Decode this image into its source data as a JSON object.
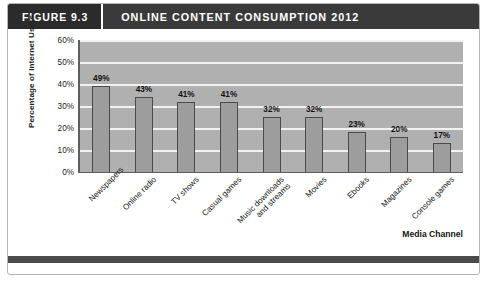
{
  "figure": {
    "number_label": "FIGURE 9.3",
    "title": "ONLINE CONTENT CONSUMPTION 2012"
  },
  "colors": {
    "header_band": "#3a3a3a",
    "figure_number_block": "#2b2b2b",
    "plot_background": "#b0b0b0",
    "gridline": "#f2f2f2",
    "bar_fill": "#9d9d9d",
    "bar_border": "#4a4a4a",
    "axis_line": "#5e5e5e",
    "bottom_rule": "#4a4a4a",
    "frame_border": "#b4b4b4"
  },
  "chart_data": {
    "type": "bar",
    "title": "ONLINE CONTENT CONSUMPTION 2012",
    "xlabel": "Media Channel",
    "ylabel": "Percentage of Internet Users",
    "ylim": [
      0,
      60
    ],
    "ytick_labels": [
      "60%",
      "50%",
      "40%",
      "30%",
      "20%",
      "10%",
      "0%"
    ],
    "yticks": [
      60,
      50,
      40,
      30,
      20,
      10,
      0
    ],
    "grid": true,
    "legend": "none",
    "categories": [
      "Newspapers",
      "Online radio",
      "TV shows",
      "Casual games",
      "Music downloads\nand streams",
      "Movies",
      "Ebooks",
      "Magazines",
      "Console games"
    ],
    "values": [
      49,
      43,
      41,
      41,
      32,
      32,
      23,
      20,
      17
    ],
    "value_labels": [
      "49%",
      "43%",
      "41%",
      "41%",
      "32%",
      "32%",
      "23%",
      "20%",
      "17%"
    ],
    "drawn_bar_heights": [
      39,
      34,
      32,
      32,
      25,
      25,
      18,
      16,
      13
    ]
  },
  "category_label_lines": [
    [
      "Newspapers"
    ],
    [
      "Online radio"
    ],
    [
      "TV shows"
    ],
    [
      "Casual games"
    ],
    [
      "Music downloads",
      "and streams"
    ],
    [
      "Movies"
    ],
    [
      "Ebooks"
    ],
    [
      "Magazines"
    ],
    [
      "Console games"
    ]
  ]
}
